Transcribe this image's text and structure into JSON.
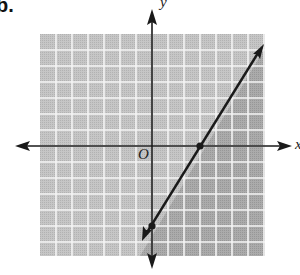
{
  "problem": {
    "label": "b."
  },
  "axes": {
    "x_label": "x",
    "y_label": "y",
    "origin_label": "O"
  },
  "colors": {
    "grid_light": "#c4c4c4",
    "grid_dark": "#a6a6a6",
    "grid_lines": "#f2f2f2",
    "ink": "#1a1a1a"
  },
  "chart_data": {
    "type": "line",
    "title": "",
    "xlabel": "x",
    "ylabel": "y",
    "xlim": [
      -7,
      7
    ],
    "ylim": [
      -7,
      7
    ],
    "grid": true,
    "series": [
      {
        "name": "boundary line",
        "equation": "y = (5/3)x - 5",
        "style": "solid",
        "points": [
          [
            0,
            -5
          ],
          [
            3,
            0
          ]
        ],
        "marked_points": [
          [
            0,
            -5
          ],
          [
            3,
            0
          ]
        ]
      }
    ],
    "shaded_region": "below/right of line (y <= (5/3)x - 5)",
    "annotations": [
      "O"
    ]
  }
}
